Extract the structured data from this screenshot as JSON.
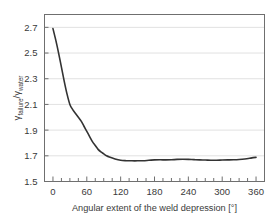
{
  "chart_data": {
    "type": "line",
    "title": "",
    "xlabel": "Angular extent of the weld depression [°]",
    "ylabel_main": "γ",
    "ylabel_sub_1": "failure",
    "ylabel_sep": "/",
    "ylabel_main_2": "γ",
    "ylabel_sub_2": "water",
    "ylabel_full": "γ failure / γ water",
    "xlim": [
      -15,
      375
    ],
    "ylim": [
      1.5,
      2.8
    ],
    "xticks": [
      0,
      60,
      120,
      180,
      240,
      300,
      360
    ],
    "xtick_labels": [
      "0",
      "60",
      "120",
      "180",
      "240",
      "300",
      "360"
    ],
    "x_minor_tick_step": 15,
    "yticks": [
      1.5,
      1.7,
      1.9,
      2.1,
      2.3,
      2.5,
      2.7
    ],
    "ytick_labels": [
      "1.5",
      "1.7",
      "1.9",
      "2.1",
      "2.3",
      "2.5",
      "2.7"
    ],
    "grid": {
      "horizontal": true,
      "vertical": false,
      "color": "#d9d9d9"
    },
    "legend": null,
    "series": [
      {
        "name": "gamma_failure_over_gamma_water",
        "color": "#333333",
        "line_width": 1.6,
        "x": [
          0,
          5,
          10,
          15,
          20,
          25,
          30,
          35,
          40,
          45,
          50,
          55,
          60,
          65,
          70,
          75,
          80,
          85,
          90,
          95,
          100,
          110,
          120,
          130,
          140,
          150,
          160,
          170,
          180,
          190,
          200,
          210,
          220,
          230,
          240,
          250,
          260,
          270,
          280,
          290,
          300,
          310,
          320,
          330,
          340,
          350,
          355,
          360
        ],
        "y": [
          2.69,
          2.6,
          2.5,
          2.39,
          2.28,
          2.18,
          2.1,
          2.06,
          2.03,
          2.0,
          1.97,
          1.93,
          1.89,
          1.85,
          1.81,
          1.78,
          1.75,
          1.73,
          1.715,
          1.7,
          1.69,
          1.675,
          1.665,
          1.662,
          1.661,
          1.661,
          1.662,
          1.665,
          1.668,
          1.669,
          1.668,
          1.669,
          1.672,
          1.673,
          1.672,
          1.67,
          1.668,
          1.667,
          1.666,
          1.666,
          1.667,
          1.668,
          1.669,
          1.671,
          1.675,
          1.682,
          1.686,
          1.688
        ]
      }
    ]
  },
  "axes": {
    "frame_color": "#6f6f6f",
    "background": "#ffffff"
  }
}
